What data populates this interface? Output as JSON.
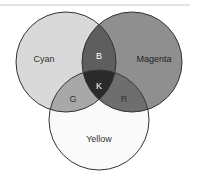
{
  "diagram": {
    "type": "venn",
    "sets": [
      {
        "label": "Cyan",
        "fill": "#d9d9d9"
      },
      {
        "label": "Magenta",
        "fill": "#8f8f8f"
      },
      {
        "label": "Yellow",
        "fill": "#fafafa"
      }
    ],
    "intersections": [
      {
        "label": "B",
        "sets": [
          "Cyan",
          "Magenta"
        ],
        "fill": "#5e5e5e"
      },
      {
        "label": "G",
        "sets": [
          "Cyan",
          "Yellow"
        ],
        "fill": "#a8a8a8"
      },
      {
        "label": "R",
        "sets": [
          "Magenta",
          "Yellow"
        ],
        "fill": "#6e6e6e"
      },
      {
        "label": "K",
        "sets": [
          "Cyan",
          "Magenta",
          "Yellow"
        ],
        "fill": "#2a2a2a"
      }
    ]
  }
}
